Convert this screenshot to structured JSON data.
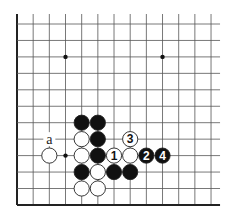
{
  "diagram": {
    "type": "go-board-fragment",
    "grid": {
      "columns": 13,
      "rows": 12,
      "x0": 17,
      "y0": 24,
      "dx": 16.17,
      "dy": 16.45,
      "line_extend_right": 9,
      "line_extend_top": 10,
      "edges": [
        "left",
        "bottom"
      ],
      "line_color": "#555555",
      "edge_color": "#222222"
    },
    "star_points": [
      {
        "col": 3,
        "row": 2
      },
      {
        "col": 9,
        "row": 2
      },
      {
        "col": 3,
        "row": 8
      }
    ],
    "stones": [
      {
        "color": "black",
        "col": 4,
        "row": 6,
        "label": ""
      },
      {
        "color": "black",
        "col": 5,
        "row": 6,
        "label": ""
      },
      {
        "color": "white",
        "col": 4,
        "row": 7,
        "label": ""
      },
      {
        "color": "black",
        "col": 5,
        "row": 7,
        "label": ""
      },
      {
        "color": "white",
        "col": 7,
        "row": 7,
        "label": "3"
      },
      {
        "color": "white",
        "col": 2,
        "row": 8,
        "label": ""
      },
      {
        "color": "white",
        "col": 4,
        "row": 8,
        "label": ""
      },
      {
        "color": "black",
        "col": 5,
        "row": 8,
        "label": ""
      },
      {
        "color": "white",
        "col": 6,
        "row": 8,
        "label": "1"
      },
      {
        "color": "white",
        "col": 7,
        "row": 8,
        "label": ""
      },
      {
        "color": "black",
        "col": 8,
        "row": 8,
        "label": "2"
      },
      {
        "color": "black",
        "col": 9,
        "row": 8,
        "label": "4"
      },
      {
        "color": "black",
        "col": 4,
        "row": 9,
        "label": ""
      },
      {
        "color": "white",
        "col": 5,
        "row": 9,
        "label": ""
      },
      {
        "color": "black",
        "col": 6,
        "row": 9,
        "label": ""
      },
      {
        "color": "black",
        "col": 7,
        "row": 9,
        "label": ""
      },
      {
        "color": "white",
        "col": 4,
        "row": 10,
        "label": ""
      },
      {
        "color": "white",
        "col": 5,
        "row": 10,
        "label": ""
      }
    ],
    "point_labels": [
      {
        "text": "a",
        "col": 2,
        "row": 7
      }
    ]
  }
}
